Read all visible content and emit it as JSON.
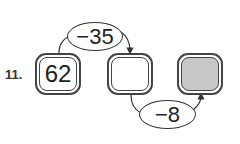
{
  "problem": {
    "number_label": "11.",
    "start_value": "62",
    "steps": [
      {
        "operation": "−35",
        "result": ""
      },
      {
        "operation": "−8",
        "result": ""
      }
    ],
    "colors": {
      "outline": "#444444",
      "answer_box_fill": "#c8c8c8",
      "background": "#ffffff"
    }
  }
}
